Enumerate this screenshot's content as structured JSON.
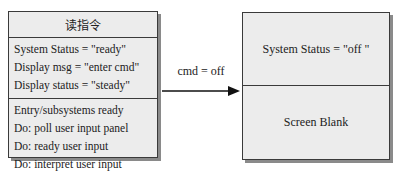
{
  "states": [
    {
      "name": "读指令",
      "attributes": [
        "System Status = \"ready\"",
        "Display msg = \"enter cmd\"",
        "Display status = \"steady\""
      ],
      "actions": [
        "Entry/subsystems ready",
        "Do: poll user input panel",
        "Do: ready user input",
        "Do: interpret user input"
      ]
    },
    {
      "attributes": [
        "System Status = \"off \""
      ],
      "actions": [
        "Screen Blank"
      ]
    }
  ],
  "transition": {
    "label": "cmd = off",
    "from": 0,
    "to": 1
  }
}
